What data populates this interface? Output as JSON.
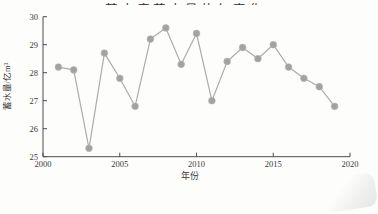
{
  "figure": {
    "title_fragment": "某水库蓄水量的年变化"
  },
  "chart_data": {
    "type": "line",
    "x": [
      2001,
      2002,
      2003,
      2004,
      2005,
      2006,
      2007,
      2008,
      2009,
      2010,
      2011,
      2012,
      2013,
      2014,
      2015,
      2016,
      2017,
      2018,
      2019
    ],
    "values": [
      28.2,
      28.1,
      25.3,
      28.7,
      27.8,
      26.8,
      29.2,
      29.6,
      28.3,
      29.4,
      27.0,
      28.4,
      28.9,
      28.5,
      29.0,
      28.2,
      27.8,
      27.5,
      26.8
    ],
    "series_name": "蓄水量",
    "xlabel": "年份",
    "ylabel": "蓄水量/亿m³",
    "xlim": [
      2000,
      2020
    ],
    "ylim": [
      25,
      30
    ],
    "x_ticks": [
      2000,
      2005,
      2010,
      2015,
      2020
    ],
    "y_ticks": [
      25,
      26,
      27,
      28,
      29,
      30
    ],
    "grid": false,
    "legend": "none",
    "marker": "circle",
    "colors": {
      "marker": "#a2a2a2",
      "line": "#acacac",
      "axis": "#4d4d4d",
      "tick_label": "#3a3a3a"
    }
  }
}
